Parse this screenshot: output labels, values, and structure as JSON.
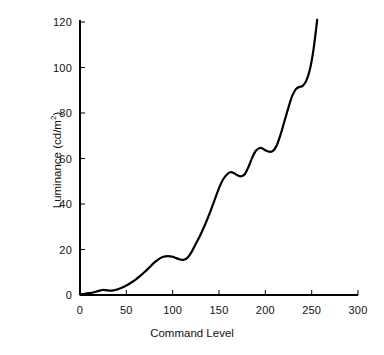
{
  "chart_data": {
    "type": "line",
    "title": "",
    "xlabel": "Command Level",
    "ylabel": "Luminance (cd/m²)",
    "ylabel_base": "Luminance (cd/m",
    "ylabel_sup": "2",
    "ylabel_close": ")",
    "xlim": [
      0,
      300
    ],
    "ylim": [
      0,
      120
    ],
    "xticks": [
      0,
      50,
      100,
      150,
      200,
      250,
      300
    ],
    "xtick_labels": [
      "0",
      "50",
      "100",
      "150",
      "200",
      "250",
      "300"
    ],
    "yticks": [
      0,
      20,
      40,
      60,
      80,
      100,
      120
    ],
    "ytick_labels": [
      "0",
      "20",
      "40",
      "60",
      "80",
      "100",
      "120"
    ],
    "grid": false,
    "legend": null,
    "line_color": "#000000",
    "line_width": 2.2,
    "axis_color": "#000000",
    "background": "#ffffff",
    "series": [
      {
        "name": "Luminance vs Command Level",
        "x": [
          0,
          5,
          10,
          15,
          20,
          24,
          28,
          32,
          36,
          40,
          45,
          50,
          55,
          60,
          65,
          70,
          75,
          80,
          85,
          90,
          95,
          100,
          104,
          108,
          112,
          116,
          120,
          125,
          130,
          135,
          140,
          145,
          150,
          155,
          160,
          163,
          166,
          170,
          174,
          178,
          182,
          186,
          190,
          194,
          197,
          200,
          204,
          208,
          212,
          216,
          220,
          225,
          229,
          233,
          237,
          240,
          244,
          248,
          252,
          256
        ],
        "y": [
          0.3,
          0.5,
          0.8,
          1.2,
          1.8,
          2.2,
          2.1,
          1.9,
          2.0,
          2.4,
          3.2,
          4.2,
          5.4,
          6.8,
          8.4,
          10.2,
          12.2,
          14.2,
          15.8,
          16.8,
          17.1,
          16.8,
          16.2,
          15.6,
          15.5,
          16.4,
          18.6,
          22.5,
          26.5,
          31.0,
          36.0,
          41.5,
          47.0,
          51.2,
          53.5,
          54.0,
          53.6,
          52.6,
          52.2,
          53.2,
          56.5,
          60.5,
          63.5,
          64.6,
          64.4,
          63.6,
          63.0,
          63.2,
          65.5,
          70.0,
          75.5,
          82.5,
          87.5,
          90.5,
          91.5,
          91.8,
          94.0,
          99.0,
          108.0,
          121.0
        ]
      }
    ]
  },
  "axes_geometry": {
    "origin_x_px": 80,
    "origin_y_px": 295,
    "x_scale_px_per_unit": 0.9267,
    "y_scale_px_per_unit": 2.275,
    "tick_len_px": 5
  }
}
